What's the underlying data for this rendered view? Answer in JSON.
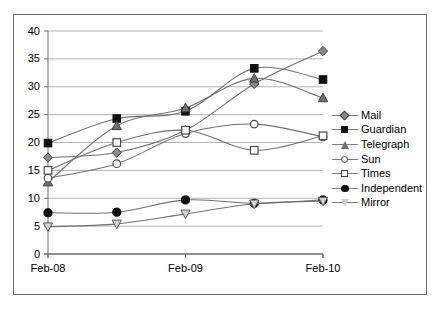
{
  "chart_data": {
    "type": "line",
    "title": "",
    "xlabel": "",
    "ylabel": "",
    "x": [
      "Feb-08",
      "",
      "Feb-09",
      "",
      "Feb-10"
    ],
    "xtick_labels": [
      "Feb-08",
      "Feb-09",
      "Feb-10"
    ],
    "ytick_labels": [
      "0",
      "5",
      "10",
      "15",
      "20",
      "25",
      "30",
      "35",
      "40"
    ],
    "ylim": [
      0,
      40
    ],
    "ytick_step": 5,
    "grid": "horizontal",
    "legend_position": "right",
    "series": [
      {
        "name": "Mail",
        "marker": "diamond-filled",
        "color": "#8a8a8a",
        "values": [
          17.3,
          18.2,
          22.2,
          30.5,
          36.4
        ]
      },
      {
        "name": "Guardian",
        "marker": "square-filled",
        "color": "#111111",
        "values": [
          19.9,
          24.3,
          25.6,
          33.3,
          31.3
        ]
      },
      {
        "name": "Telegraph",
        "marker": "triangle-up",
        "color": "#6f6f6f",
        "values": [
          12.9,
          23.0,
          26.2,
          31.5,
          28.0
        ]
      },
      {
        "name": "Sun",
        "marker": "circle-open",
        "color": "#4a4a4a",
        "values": [
          13.6,
          16.2,
          21.6,
          23.3,
          21.0
        ]
      },
      {
        "name": "Times",
        "marker": "square-open",
        "color": "#4a4a4a",
        "values": [
          15.0,
          20.0,
          22.2,
          18.6,
          21.2
        ]
      },
      {
        "name": "Independent",
        "marker": "circle-filled",
        "color": "#0d0d0d",
        "values": [
          7.4,
          7.5,
          9.7,
          9.1,
          9.7
        ]
      },
      {
        "name": "Mirror",
        "marker": "triangle-down",
        "color": "#cdcdcd",
        "values": [
          4.9,
          5.4,
          7.2,
          9.0,
          9.5
        ]
      }
    ]
  },
  "legend": {
    "items": [
      {
        "label": "Mail"
      },
      {
        "label": "Guardian"
      },
      {
        "label": "Telegraph"
      },
      {
        "label": "Sun"
      },
      {
        "label": "Times"
      },
      {
        "label": "Independent"
      },
      {
        "label": "Mirror"
      }
    ]
  }
}
